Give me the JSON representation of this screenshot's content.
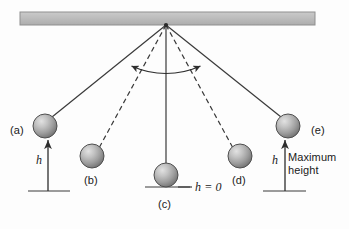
{
  "figure": {
    "background_color": "#fdfdfd",
    "ceiling": {
      "name": "support-bar",
      "fill_color": "#bcbcbc",
      "border_color": "#8d8d8d"
    },
    "pivot": {
      "name": "pivot-point",
      "x": 166,
      "y": 25
    },
    "arc": {
      "name": "swing-arc",
      "style": "double-headed-arrow",
      "color": "#2e2e2e"
    },
    "stroke_color": "#3a3a3a",
    "sphere": {
      "fill_light": "#d4d4d4",
      "fill_mid": "#a8a8a8",
      "fill_dark": "#6e6e6e",
      "edge_color": "#4a4a4a"
    },
    "positions": [
      {
        "id": "a",
        "label": "(a)",
        "line_style": "solid",
        "bob_x": 45,
        "bob_y": 126,
        "radius": 12,
        "label_x": 12,
        "label_y": 130,
        "height_marker": true,
        "height_label": "h"
      },
      {
        "id": "b",
        "label": "(b)",
        "line_style": "dashed",
        "bob_x": 92,
        "bob_y": 156,
        "radius": 12,
        "label_x": 85,
        "label_y": 180,
        "height_marker": false,
        "height_label": ""
      },
      {
        "id": "c",
        "label": "(c)",
        "line_style": "solid",
        "bob_x": 166,
        "bob_y": 175,
        "radius": 12,
        "label_x": 159,
        "label_y": 203,
        "height_marker": false,
        "height_label": "h = 0"
      },
      {
        "id": "d",
        "label": "(d)",
        "line_style": "dashed",
        "bob_x": 240,
        "bob_y": 156,
        "radius": 12,
        "label_x": 233,
        "label_y": 180,
        "height_marker": false,
        "height_label": ""
      },
      {
        "id": "e",
        "label": "(e)",
        "line_style": "solid",
        "bob_x": 288,
        "bob_y": 126,
        "radius": 12,
        "label_x": 313,
        "label_y": 130,
        "height_marker": true,
        "height_label": "h"
      }
    ],
    "annotations": {
      "height_a_label": "h",
      "height_e_label": "h",
      "zero_height_label": "h = 0",
      "max_height_line1": "Maximum",
      "max_height_line2": "height"
    }
  }
}
